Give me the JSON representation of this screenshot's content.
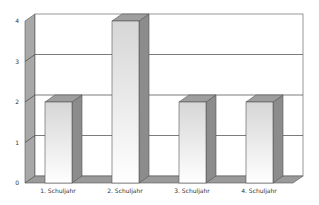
{
  "chart_data": {
    "type": "bar",
    "style": "3d-column",
    "title": "",
    "xlabel": "",
    "ylabel": "",
    "categories": [
      "1. Schuljahr",
      "2. Schuljahr",
      "3. Schuljahr",
      "4. Schuljahr"
    ],
    "values": [
      2,
      4,
      2,
      2
    ],
    "ylim": [
      0,
      4
    ],
    "yticks": [
      "0",
      "1",
      "2",
      "3",
      "4"
    ],
    "grid": true,
    "legend": "none"
  },
  "colors": {
    "wall_side": "#a8a8a8",
    "floor": "#9a9a9a",
    "bar_front_top": "#d8d8d8",
    "bar_front_bottom": "#ffffff",
    "bar_side": "#8c8c8c",
    "bar_top": "#9e9e9e",
    "gridline": "#444444",
    "outline": "#555555"
  }
}
